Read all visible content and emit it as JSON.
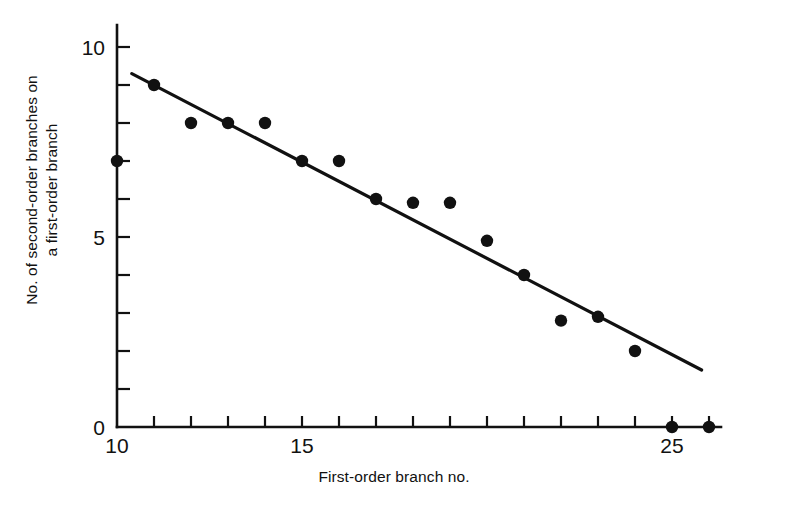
{
  "chart_data": {
    "type": "scatter",
    "title": "",
    "xlabel": "First-order branch no.",
    "ylabel_line1": "No. of second-order branches on",
    "ylabel_line2": "a first-order branch",
    "xlim": [
      10,
      26
    ],
    "ylim": [
      0,
      10
    ],
    "x_tick_labels": [
      "10",
      "15",
      "25"
    ],
    "x_labeled_ticks": [
      10,
      15,
      25
    ],
    "x_all_ticks": [
      10,
      11,
      12,
      13,
      14,
      15,
      16,
      17,
      18,
      19,
      20,
      21,
      22,
      23,
      24,
      25,
      26
    ],
    "y_tick_labels": [
      "0",
      "5",
      "10"
    ],
    "y_labeled_ticks": [
      0,
      5,
      10
    ],
    "y_all_ticks": [
      0,
      1,
      2,
      3,
      4,
      5,
      6,
      7,
      8,
      9,
      10
    ],
    "grid": false,
    "legend": false,
    "marker": "filled-circle",
    "marker_color": "#111111",
    "line_color": "#111111",
    "x": [
      10,
      11,
      12,
      13,
      14,
      15,
      16,
      17,
      18,
      19,
      20,
      21,
      22,
      23,
      24,
      25,
      26
    ],
    "y": [
      7,
      9,
      8,
      8,
      8,
      7,
      7,
      6,
      5.9,
      5.9,
      4.9,
      4,
      2.8,
      2.9,
      2,
      0,
      0
    ],
    "points": [
      {
        "x": 10,
        "y": 7
      },
      {
        "x": 11,
        "y": 9
      },
      {
        "x": 12,
        "y": 8
      },
      {
        "x": 13,
        "y": 8
      },
      {
        "x": 14,
        "y": 8
      },
      {
        "x": 15,
        "y": 7
      },
      {
        "x": 16,
        "y": 7
      },
      {
        "x": 17,
        "y": 6
      },
      {
        "x": 18,
        "y": 5.9
      },
      {
        "x": 19,
        "y": 5.9
      },
      {
        "x": 20,
        "y": 4.9
      },
      {
        "x": 21,
        "y": 4
      },
      {
        "x": 22,
        "y": 2.8
      },
      {
        "x": 23,
        "y": 2.9
      },
      {
        "x": 24,
        "y": 2
      },
      {
        "x": 25,
        "y": 0
      },
      {
        "x": 26,
        "y": 0
      }
    ],
    "trend_line": {
      "name": "fitted regression line",
      "x_start": 10.4,
      "y_start": 9.3,
      "x_end": 25.8,
      "y_end": 1.5
    }
  }
}
